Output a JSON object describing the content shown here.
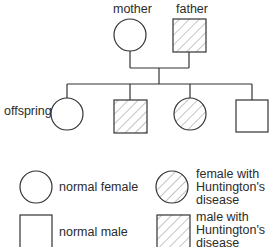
{
  "diagram": {
    "type": "pedigree",
    "parents": {
      "mother_label": "mother",
      "father_label": "father"
    },
    "generation2_label": "offspring",
    "individuals": [
      {
        "role": "mother",
        "sex": "female",
        "affected": false
      },
      {
        "role": "father",
        "sex": "male",
        "affected": true
      },
      {
        "role": "offspring",
        "sex": "female",
        "affected": false
      },
      {
        "role": "offspring",
        "sex": "male",
        "affected": true
      },
      {
        "role": "offspring",
        "sex": "female",
        "affected": true
      },
      {
        "role": "offspring",
        "sex": "male",
        "affected": false
      }
    ],
    "legend": {
      "normal_female": "normal female",
      "normal_male": "normal male",
      "affected_female": "female with Huntington's disease",
      "affected_male": "male with Huntington's disease"
    },
    "colors": {
      "stroke": "#333333",
      "hatch": "#8a8a8a",
      "text": "#2b2b2b"
    }
  }
}
